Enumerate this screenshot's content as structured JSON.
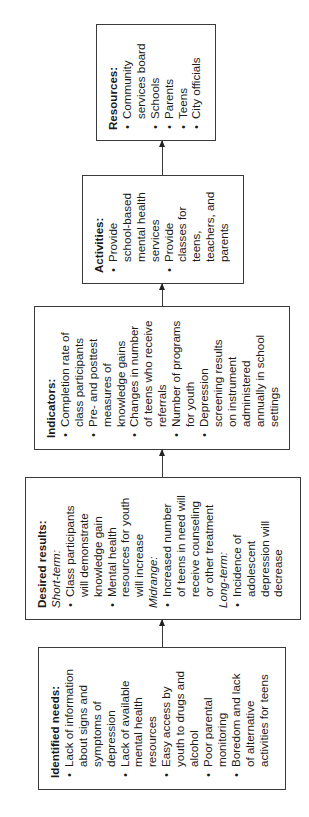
{
  "diagram": {
    "boxes": [
      {
        "id": "identified-needs",
        "title": "Identified needs:",
        "items": [
          "Lack of information\nabout signs and\nsymptoms of\ndepression",
          "Lack of available\nmental health\nresources",
          "Easy access by\nyouth to drugs and\nalcohol",
          "Poor parental\nmonitoring",
          "Boredom and lack\nof alternative\nactivities for teens"
        ]
      },
      {
        "id": "desired-results",
        "title": "Desired results:",
        "groups": [
          {
            "label": "Short-term:",
            "items": [
              "Class participants\nwill demonstrate\nknowledge gain",
              "Mental health\nresources for youth\nwill increase"
            ]
          },
          {
            "label": "Midrange:",
            "items": [
              "Increased number\nof teens in need will\nreceive counseling\nor other treatment"
            ]
          },
          {
            "label": "Long-term:",
            "items": [
              "Incidence of\nadolescent\ndepression will\ndecrease"
            ]
          }
        ]
      },
      {
        "id": "indicators",
        "title": "Indicators:",
        "items": [
          "Completion rate of\nclass participants",
          "Pre- and posttest\nmeasures of\nknowledge gains",
          "Changes in number\nof teens who receive\nreferrals",
          "Number of programs\nfor youth",
          "Depression\nscreening results\non instrument\nadministered\nannually in school\nsettings"
        ]
      },
      {
        "id": "activities",
        "title": "Activities:",
        "items": [
          "Provide\nschool-based\nmental health\nservices",
          "Provide\nclasses for\nteens,\nteachers, and\nparents"
        ]
      },
      {
        "id": "resources",
        "title": "Resources:",
        "items": [
          "Community\nservices board",
          "Schools",
          "Parents",
          "Teens",
          "City officials"
        ]
      }
    ],
    "bullet_glyph": "•",
    "flow_direction": "identified-needs → desired-results → indicators → activities → resources",
    "line_color": "#3a3a3a",
    "text_color": "#1a1a1a"
  }
}
